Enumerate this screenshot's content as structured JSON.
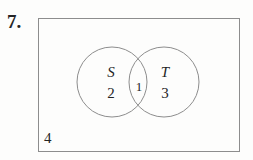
{
  "figure": {
    "problem_number": "7.",
    "type": "venn-diagram",
    "universal_set": {
      "shape": "rectangle",
      "outside_count": "4"
    },
    "sets": [
      {
        "name": "S",
        "label": "S",
        "only_count": "2",
        "position": "left"
      },
      {
        "name": "T",
        "label": "T",
        "only_count": "3",
        "position": "right"
      }
    ],
    "intersection": {
      "label": "S and T",
      "count": "1"
    },
    "colors": {
      "stroke": "#8d8d8d",
      "text": "#242424",
      "background": "#fdfdfc"
    }
  }
}
